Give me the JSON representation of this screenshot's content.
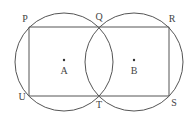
{
  "diagram": {
    "stroke_color": "#555555",
    "circles": [
      {
        "name": "circle-A",
        "center_label": "A",
        "cx": 64,
        "cy": 62,
        "r": 49
      },
      {
        "name": "circle-B",
        "center_label": "B",
        "cx": 134,
        "cy": 62,
        "r": 49
      }
    ],
    "rectangle": {
      "corners": [
        "P",
        "R",
        "S",
        "U"
      ],
      "x1": 29,
      "y1": 27,
      "x2": 169,
      "y2": 96
    },
    "segment": {
      "from": "Q",
      "to": "T"
    },
    "points": {
      "P": {
        "label": "P",
        "x": 29,
        "y": 27
      },
      "Q": {
        "label": "Q",
        "x": 99,
        "y": 27
      },
      "R": {
        "label": "R",
        "x": 169,
        "y": 27
      },
      "S": {
        "label": "S",
        "x": 169,
        "y": 96
      },
      "T": {
        "label": "T",
        "x": 99,
        "y": 96
      },
      "U": {
        "label": "U",
        "x": 29,
        "y": 96
      },
      "A": {
        "label": "A",
        "x": 64,
        "y": 61
      },
      "B": {
        "label": "B",
        "x": 134,
        "y": 61
      }
    }
  }
}
